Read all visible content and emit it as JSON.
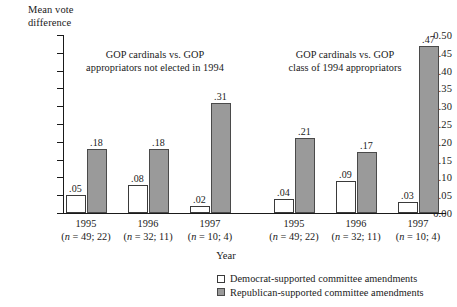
{
  "chart_data": {
    "type": "bar",
    "title": "",
    "xlabel": "Year",
    "ylabel": "Mean vote\ndifference",
    "ylim": [
      0.0,
      0.5
    ],
    "ytick_labels": [
      "0.50",
      "0.45",
      "0.40",
      "0.35",
      "0.30",
      "0.25",
      "0.20",
      "0.15",
      "0.10",
      "0.05",
      "0.00"
    ],
    "ytick_values": [
      0.5,
      0.45,
      0.4,
      0.35,
      0.3,
      0.25,
      0.2,
      0.15,
      0.1,
      0.05,
      0.0
    ],
    "grid": false,
    "legend_position": "bottom-right",
    "legend": [
      {
        "key": "dem",
        "label": "Democrat-supported committee amendments",
        "color": "#ffffff"
      },
      {
        "key": "rep",
        "label": "Republican-supported committee amendments",
        "color": "#9a9a9a"
      }
    ],
    "series": [
      {
        "name": "Democrat-supported committee amendments",
        "key": "dem",
        "values": [
          0.05,
          0.08,
          0.02,
          0.04,
          0.09,
          0.03
        ]
      },
      {
        "name": "Republican-supported committee amendments",
        "key": "rep",
        "values": [
          0.18,
          0.18,
          0.31,
          0.21,
          0.17,
          0.47
        ]
      }
    ],
    "value_labels": {
      "dem": [
        ".05",
        ".08",
        ".02",
        ".04",
        ".09",
        ".03"
      ],
      "rep": [
        ".18",
        ".18",
        ".31",
        ".21",
        ".17",
        ".47"
      ]
    },
    "categories": [
      "1995",
      "1996",
      "1997",
      "1995",
      "1996",
      "1997"
    ],
    "category_notes": [
      "(n = 49; 22)",
      "(n = 32; 11)",
      "(n = 10; 4)",
      "(n = 49; 22)",
      "(n = 32; 11)",
      "(n = 10; 4)"
    ],
    "groups": [
      {
        "caption": "GOP cardinals vs. GOP\nappropriators not elected in 1994",
        "categories": [
          "1995",
          "1996",
          "1997"
        ],
        "n_notes": [
          "(n = 49; 22)",
          "(n = 32; 11)",
          "(n = 10; 4)"
        ],
        "dem": [
          0.05,
          0.08,
          0.02
        ],
        "rep": [
          0.18,
          0.18,
          0.31
        ]
      },
      {
        "caption": "GOP cardinals vs. GOP\nclass of 1994 appropriators",
        "categories": [
          "1995",
          "1996",
          "1997"
        ],
        "n_notes": [
          "(n = 49; 22)",
          "(n = 32; 11)",
          "(n = 10; 4)"
        ],
        "dem": [
          0.04,
          0.09,
          0.03
        ],
        "rep": [
          0.21,
          0.17,
          0.47
        ]
      }
    ]
  },
  "axis": {
    "y_title": "Mean vote\ndifference",
    "x_title": "Year",
    "ticks": [
      {
        "label": "0.50",
        "value": 0.5
      },
      {
        "label": "0.45",
        "value": 0.45
      },
      {
        "label": "0.40",
        "value": 0.4
      },
      {
        "label": "0.35",
        "value": 0.35
      },
      {
        "label": "0.30",
        "value": 0.3
      },
      {
        "label": "0.25",
        "value": 0.25
      },
      {
        "label": "0.20",
        "value": 0.2
      },
      {
        "label": "0.15",
        "value": 0.15
      },
      {
        "label": "0.10",
        "value": 0.1
      },
      {
        "label": "0.05",
        "value": 0.05
      },
      {
        "label": "0.00",
        "value": 0.0
      }
    ]
  },
  "captions": {
    "left": "GOP cardinals vs. GOP\nappropriators not elected in 1994",
    "right": "GOP cardinals vs. GOP\nclass of 1994 appropriators"
  },
  "colors": {
    "democrat_bar": "#ffffff",
    "republican_bar": "#9a9a9a",
    "axis": "#1a1a1a",
    "bar_outline": "#3a3a3a",
    "background": "#ffffff"
  }
}
